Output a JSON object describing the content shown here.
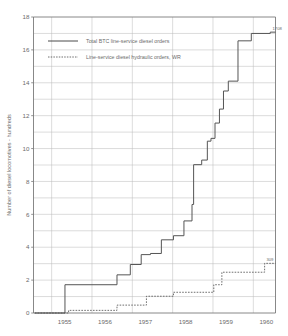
{
  "chart_data": {
    "type": "line",
    "title": "",
    "subtitle": "",
    "xlabel": "",
    "ylabel": "Number of diesel locomotives - hundreds",
    "xlim": [
      1954.55,
      1960.55
    ],
    "ylim": [
      0,
      18
    ],
    "grid": true,
    "grid_axes": "both",
    "y_ticks": [
      0,
      2,
      4,
      6,
      8,
      10,
      12,
      14,
      16,
      18
    ],
    "y_tick_labels": [
      "0",
      "2",
      "4",
      "6",
      "8",
      "10",
      "12",
      "14",
      "16",
      "18"
    ],
    "x_ticks": [
      1955,
      1956,
      1957,
      1958,
      1959,
      1960
    ],
    "x_tick_labels": [
      "1955",
      "1956",
      "1957",
      "1958",
      "1959",
      "1960"
    ],
    "step_mode": "post",
    "legend_position": "upper-left-inside",
    "series": [
      {
        "name": "Total BTC line-service diesel orders",
        "style": "solid",
        "color": "#555555",
        "end_label": "1708",
        "x": [
          1954.58,
          1955.33,
          1955.33,
          1956.62,
          1956.62,
          1956.95,
          1956.95,
          1957.22,
          1957.22,
          1957.45,
          1957.45,
          1957.72,
          1957.72,
          1958.02,
          1958.02,
          1958.28,
          1958.28,
          1958.48,
          1958.48,
          1958.52,
          1958.52,
          1958.72,
          1958.72,
          1958.86,
          1958.86,
          1958.95,
          1958.95,
          1959.05,
          1959.05,
          1959.16,
          1959.16,
          1959.26,
          1959.26,
          1959.38,
          1959.38,
          1959.62,
          1959.62,
          1959.95,
          1959.95,
          1960.42,
          1960.42,
          1960.55
        ],
        "y": [
          0.0,
          0.0,
          1.72,
          1.72,
          2.32,
          2.32,
          2.95,
          2.95,
          3.55,
          3.55,
          3.62,
          3.62,
          4.45,
          4.45,
          4.7,
          4.7,
          5.6,
          5.6,
          6.6,
          6.6,
          9.02,
          9.02,
          9.3,
          9.3,
          10.45,
          10.45,
          10.62,
          10.62,
          11.55,
          11.55,
          12.4,
          12.4,
          13.5,
          13.5,
          14.1,
          14.1,
          16.55,
          16.55,
          17.0,
          17.0,
          17.08,
          17.08
        ],
        "annotated_final_value": 17.08
      },
      {
        "name": "Line-service diesel hydraulic orders, WR",
        "style": "dashed",
        "color": "#555555",
        "end_label": "309",
        "x": [
          1954.58,
          1955.42,
          1955.42,
          1956.62,
          1956.62,
          1957.35,
          1957.35,
          1958.02,
          1958.02,
          1959.02,
          1959.02,
          1959.22,
          1959.22,
          1960.28,
          1960.28,
          1960.55
        ],
        "y": [
          0.0,
          0.0,
          0.16,
          0.16,
          0.48,
          0.48,
          1.02,
          1.02,
          1.26,
          1.26,
          1.72,
          1.72,
          2.48,
          2.48,
          3.02,
          3.02
        ],
        "annotated_final_value": 3.09
      }
    ],
    "annotations": [
      {
        "text": "1708",
        "x": 1960.45,
        "y": 17.08,
        "series": "Total BTC line-service diesel orders"
      },
      {
        "text": "309",
        "x": 1960.3,
        "y": 3.02,
        "series": "Line-service diesel hydraulic orders, WR"
      }
    ],
    "legend": [
      {
        "label": "Total BTC line-service diesel orders",
        "style": "solid"
      },
      {
        "label": "Line-service diesel hydraulic orders, WR",
        "style": "dashed"
      }
    ]
  }
}
